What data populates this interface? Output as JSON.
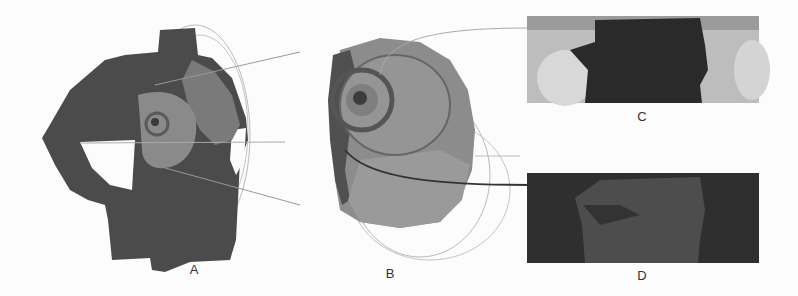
{
  "figure": {
    "panels": [
      {
        "id": "A",
        "label": "A",
        "description": "3D torso scan with highlighted breast region and projection circles"
      },
      {
        "id": "B",
        "label": "B",
        "description": "Enlarged breast region with concentric contours"
      },
      {
        "id": "C",
        "label": "C",
        "description": "Unwrapped surface map, upper"
      },
      {
        "id": "D",
        "label": "D",
        "description": "Unwrapped surface map, lower (dark)"
      }
    ],
    "colors": {
      "background": "#fcfcfc",
      "body_dark": "#4a4a4a",
      "body_region": "#7d7d7d",
      "guide_lines": "#aaaaaa",
      "panel_c_bg": "#b9b9b9",
      "panel_d_bg": "#2e2e2e"
    }
  }
}
